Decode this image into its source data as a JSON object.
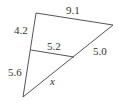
{
  "diagram": {
    "type": "triangle-with-parallel-segment",
    "stroke_color": "#555555",
    "text_color": "#333333",
    "vertices": {
      "top_left": [
        36,
        13
      ],
      "top_right": [
        113,
        25
      ],
      "bottom": [
        23,
        97
      ]
    },
    "inner_segment": {
      "start": [
        31,
        50
      ],
      "end": [
        74,
        57
      ]
    },
    "labels": {
      "top_side": "9.1",
      "left_upper": "4.2",
      "left_lower": "5.6",
      "inner_segment": "5.2",
      "right_upper": "5.0",
      "right_lower": "x"
    }
  }
}
